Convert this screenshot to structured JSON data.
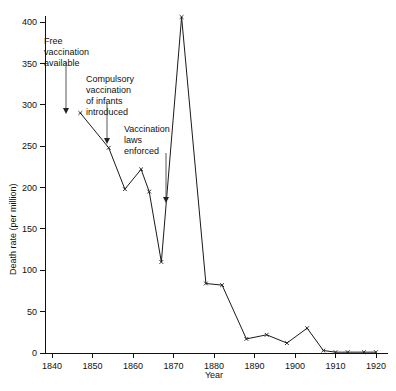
{
  "chart_data": {
    "type": "line",
    "title": "",
    "xlabel": "Year",
    "ylabel": "Death rate (per million)",
    "xlim": [
      1838,
      1922
    ],
    "ylim": [
      0,
      420
    ],
    "xticks": [
      1840,
      1850,
      1860,
      1870,
      1880,
      1890,
      1900,
      1910,
      1920
    ],
    "yticks": [
      0,
      50,
      100,
      150,
      200,
      250,
      300,
      350,
      400
    ],
    "grid": false,
    "legend": null,
    "marker": "x",
    "series": [
      {
        "name": "Smallpox death rate",
        "x": [
          1847,
          1854,
          1858,
          1862,
          1864,
          1867,
          1872,
          1878,
          1882,
          1888,
          1893,
          1898,
          1903,
          1907,
          1910,
          1913,
          1917,
          1920
        ],
        "values": [
          290,
          248,
          198,
          222,
          195,
          110,
          406,
          84,
          82,
          17,
          22,
          12,
          30,
          3,
          1,
          1,
          1,
          1
        ]
      }
    ],
    "annotations": [
      {
        "id": "free-vaccination",
        "lines": [
          "Free",
          "vaccination",
          "available"
        ],
        "text_x": 44,
        "text_y": 44,
        "arrow_x": 66,
        "arrow_y0": 62,
        "arrow_y1": 114
      },
      {
        "id": "compulsory-vaccination",
        "lines": [
          "Compulsory",
          "vaccination",
          "of infants",
          "introduced"
        ],
        "text_x": 86,
        "text_y": 82,
        "arrow_x": 107,
        "arrow_y0": 103,
        "arrow_y1": 144
      },
      {
        "id": "vaccination-laws",
        "lines": [
          "Vaccination",
          "laws",
          "enforced"
        ],
        "text_x": 124,
        "text_y": 132,
        "arrow_x": 166,
        "arrow_y0": 153,
        "arrow_y1": 203
      }
    ]
  },
  "axes": {
    "x_title": "Year",
    "y_title": "Death rate (per million)",
    "x_tick_labels": [
      "1840",
      "1850",
      "1860",
      "1870",
      "1880",
      "1890",
      "1900",
      "1910",
      "1920"
    ],
    "y_tick_labels": [
      "0",
      "50",
      "100",
      "150",
      "200",
      "250",
      "300",
      "350",
      "400"
    ]
  },
  "colors": {
    "ink": "#111111",
    "line": "#1a1a1a",
    "annotation": "#444444",
    "background": "#ffffff"
  }
}
